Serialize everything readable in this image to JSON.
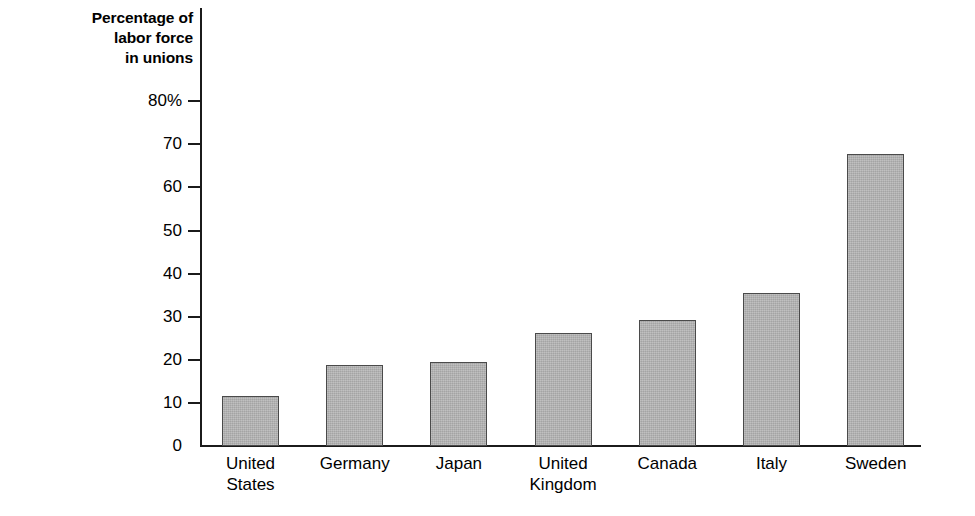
{
  "chart_data": {
    "type": "bar",
    "title": "",
    "ylabel": "Percentage of labor force in unions",
    "ylabel_lines": [
      "Percentage of",
      "labor force",
      "in unions"
    ],
    "xlabel": "",
    "categories": [
      "United States",
      "Germany",
      "Japan",
      "United Kingdom",
      "Canada",
      "Italy",
      "Sweden"
    ],
    "category_lines": [
      [
        "United",
        "States"
      ],
      [
        "Germany"
      ],
      [
        "Japan"
      ],
      [
        "United",
        "Kingdom"
      ],
      [
        "Canada"
      ],
      [
        "Italy"
      ],
      [
        "Sweden"
      ]
    ],
    "values": [
      11.5,
      18.8,
      19.4,
      26.3,
      29.3,
      35.4,
      67.8
    ],
    "ylim": [
      0,
      80
    ],
    "yticks": [
      0,
      10,
      20,
      30,
      40,
      50,
      60,
      70,
      80
    ],
    "ytick_labels": [
      "0",
      "10",
      "20",
      "30",
      "40",
      "50",
      "60",
      "70",
      "80%"
    ],
    "grid": false,
    "legend": false,
    "bar_fill_color": "#b2b2b2",
    "bar_border_color": "#4a4a4a",
    "axis_color": "#1b1b1b",
    "background_color": "#ffffff"
  }
}
